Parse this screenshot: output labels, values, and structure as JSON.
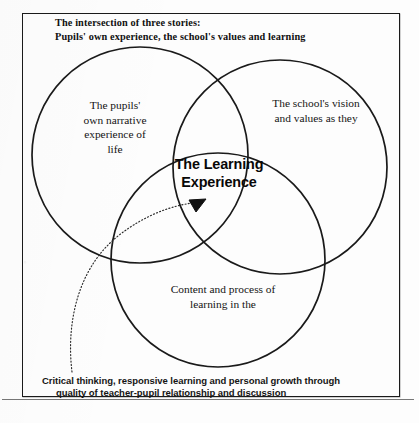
{
  "figure": {
    "title": {
      "line1": "The intersection of three stories:",
      "line2": "Pupils' own experience, the school's values and learning"
    },
    "circles": [
      {
        "id": "left",
        "label": "The pupils' own narrative experience of life",
        "lines": [
          "The pupils'",
          "own narrative",
          "experience of",
          "life"
        ]
      },
      {
        "id": "right",
        "label": "The school's vision and values as they",
        "lines": [
          "The school's vision",
          "and values as they"
        ]
      },
      {
        "id": "bottom",
        "label": "Content and process of learning in the",
        "lines": [
          "Content and process of",
          "learning in the"
        ]
      }
    ],
    "center": {
      "line1": "The Learning",
      "line2": "Experience"
    },
    "caption": {
      "line1": "Critical thinking, responsive learning and personal growth through",
      "line2": "quality of teacher-pupil relationship and discussion"
    },
    "colors": {
      "stroke": "#1a1a1a",
      "text": "#141414",
      "background": "#fdfdfd"
    }
  }
}
